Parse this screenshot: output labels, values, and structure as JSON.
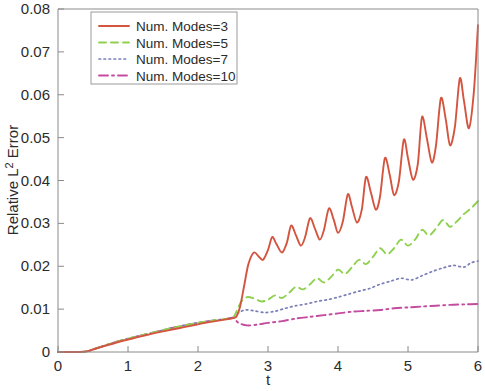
{
  "chart_data": {
    "type": "line",
    "title": "",
    "xlabel": "t",
    "ylabel": "Relative L^2 Error",
    "ylabel_display": "Relative L",
    "ylabel_sup": "2",
    "ylabel_tail": " Error",
    "xlim": [
      0,
      6
    ],
    "ylim": [
      0,
      0.08
    ],
    "xticks": [
      0,
      1,
      2,
      3,
      4,
      5,
      6
    ],
    "xtick_labels": [
      "0",
      "1",
      "2",
      "3",
      "4",
      "5",
      "6"
    ],
    "yticks": [
      0,
      0.01,
      0.02,
      0.03,
      0.04,
      0.05,
      0.06,
      0.07,
      0.08
    ],
    "ytick_labels": [
      "0",
      "0.01",
      "0.02",
      "0.03",
      "0.04",
      "0.05",
      "0.06",
      "0.07",
      "0.08"
    ],
    "grid": false,
    "legend_position": "top-left-inside",
    "series": [
      {
        "name": "Num. Modes=3",
        "color": "#d4553f",
        "dash": "solid",
        "width": 1.9,
        "x": [
          0.0,
          0.15,
          0.3,
          0.42,
          0.5,
          0.62,
          0.75,
          0.9,
          1.05,
          1.2,
          1.35,
          1.5,
          1.65,
          1.8,
          1.95,
          2.1,
          2.25,
          2.4,
          2.5,
          2.55,
          2.6,
          2.66,
          2.72,
          2.8,
          2.87,
          2.93,
          3.0,
          3.06,
          3.12,
          3.2,
          3.27,
          3.33,
          3.4,
          3.47,
          3.53,
          3.6,
          3.67,
          3.74,
          3.8,
          3.87,
          3.94,
          4.0,
          4.07,
          4.14,
          4.2,
          4.27,
          4.34,
          4.4,
          4.47,
          4.54,
          4.6,
          4.67,
          4.74,
          4.8,
          4.87,
          4.94,
          5.0,
          5.07,
          5.14,
          5.2,
          5.27,
          5.34,
          5.4,
          5.47,
          5.54,
          5.6,
          5.67,
          5.74,
          5.8,
          5.87,
          5.94,
          6.0
        ],
        "y": [
          0.0,
          0.0,
          0.0,
          0.0002,
          0.0006,
          0.0012,
          0.0018,
          0.0025,
          0.0031,
          0.0037,
          0.0043,
          0.0048,
          0.0053,
          0.0058,
          0.0063,
          0.0068,
          0.0072,
          0.0076,
          0.0079,
          0.0083,
          0.0105,
          0.0155,
          0.0205,
          0.0232,
          0.0222,
          0.0215,
          0.0238,
          0.0268,
          0.0252,
          0.0232,
          0.0255,
          0.0295,
          0.0272,
          0.0248,
          0.0268,
          0.0312,
          0.0288,
          0.0262,
          0.0285,
          0.0335,
          0.0308,
          0.0278,
          0.0305,
          0.0368,
          0.0338,
          0.0302,
          0.0332,
          0.0408,
          0.0372,
          0.0332,
          0.0362,
          0.0452,
          0.0412,
          0.0366,
          0.0398,
          0.0495,
          0.0452,
          0.0402,
          0.0438,
          0.0548,
          0.0498,
          0.0442,
          0.0482,
          0.0592,
          0.0542,
          0.0482,
          0.0525,
          0.0638,
          0.0585,
          0.0522,
          0.0605,
          0.0762
        ]
      },
      {
        "name": "Num. Modes=5",
        "color": "#8fd14f",
        "dash": "dashed",
        "width": 1.9,
        "x": [
          0.0,
          0.2,
          0.4,
          0.5,
          0.65,
          0.8,
          1.0,
          1.2,
          1.4,
          1.6,
          1.8,
          2.0,
          2.2,
          2.4,
          2.5,
          2.56,
          2.62,
          2.7,
          2.8,
          2.9,
          3.0,
          3.1,
          3.2,
          3.3,
          3.4,
          3.5,
          3.6,
          3.7,
          3.8,
          3.9,
          4.0,
          4.1,
          4.2,
          4.3,
          4.4,
          4.5,
          4.6,
          4.7,
          4.8,
          4.9,
          5.0,
          5.1,
          5.2,
          5.3,
          5.4,
          5.5,
          5.6,
          5.7,
          5.8,
          5.9,
          6.0
        ],
        "y": [
          0.0,
          0.0,
          0.0001,
          0.0006,
          0.0014,
          0.0022,
          0.0031,
          0.0039,
          0.0047,
          0.0055,
          0.0062,
          0.0068,
          0.0073,
          0.0077,
          0.008,
          0.0098,
          0.0118,
          0.0128,
          0.0125,
          0.0118,
          0.0122,
          0.0132,
          0.0126,
          0.0138,
          0.0152,
          0.0146,
          0.0158,
          0.0172,
          0.0162,
          0.0175,
          0.0192,
          0.0182,
          0.0198,
          0.0215,
          0.0205,
          0.0222,
          0.0242,
          0.0228,
          0.0242,
          0.0262,
          0.0248,
          0.0262,
          0.0285,
          0.0272,
          0.0288,
          0.0308,
          0.0292,
          0.0305,
          0.0322,
          0.0335,
          0.0352
        ]
      },
      {
        "name": "Num. Modes=7",
        "color": "#7a7fb8",
        "dash": "dotted",
        "width": 1.7,
        "x": [
          0.0,
          0.2,
          0.4,
          0.5,
          0.65,
          0.8,
          1.0,
          1.2,
          1.4,
          1.6,
          1.8,
          2.0,
          2.2,
          2.4,
          2.5,
          2.58,
          2.68,
          2.8,
          2.95,
          3.1,
          3.25,
          3.4,
          3.55,
          3.7,
          3.85,
          4.0,
          4.15,
          4.3,
          4.45,
          4.6,
          4.75,
          4.9,
          5.05,
          5.2,
          5.35,
          5.5,
          5.65,
          5.8,
          5.9,
          6.0
        ],
        "y": [
          0.0,
          0.0,
          0.0001,
          0.0006,
          0.0014,
          0.0022,
          0.0031,
          0.0039,
          0.0047,
          0.0055,
          0.0062,
          0.0068,
          0.0073,
          0.0077,
          0.008,
          0.0092,
          0.0098,
          0.0096,
          0.0092,
          0.0095,
          0.0102,
          0.0108,
          0.0112,
          0.0118,
          0.0122,
          0.0128,
          0.0135,
          0.0142,
          0.0148,
          0.0158,
          0.0165,
          0.0172,
          0.0168,
          0.0178,
          0.0188,
          0.0196,
          0.0202,
          0.0198,
          0.0208,
          0.0212
        ]
      },
      {
        "name": "Num. Modes=10",
        "color": "#c44ca0",
        "dash": "dashdot",
        "width": 1.9,
        "x": [
          0.0,
          0.2,
          0.4,
          0.5,
          0.65,
          0.8,
          1.0,
          1.2,
          1.4,
          1.6,
          1.8,
          2.0,
          2.2,
          2.4,
          2.5,
          2.58,
          2.7,
          2.85,
          3.0,
          3.2,
          3.4,
          3.6,
          3.8,
          4.0,
          4.2,
          4.4,
          4.6,
          4.8,
          5.0,
          5.2,
          5.4,
          5.6,
          5.8,
          6.0
        ],
        "y": [
          0.0,
          0.0,
          0.0001,
          0.0006,
          0.0014,
          0.0022,
          0.0031,
          0.0039,
          0.0047,
          0.0055,
          0.0062,
          0.0068,
          0.0073,
          0.0077,
          0.008,
          0.0068,
          0.0062,
          0.0064,
          0.0068,
          0.0072,
          0.0078,
          0.0082,
          0.0086,
          0.009,
          0.0094,
          0.0096,
          0.0098,
          0.0102,
          0.0104,
          0.0106,
          0.0108,
          0.011,
          0.0111,
          0.0112
        ]
      }
    ]
  },
  "legend": {
    "entries": [
      {
        "label": "Num. Modes=3"
      },
      {
        "label": "Num. Modes=5"
      },
      {
        "label": "Num. Modes=7"
      },
      {
        "label": "Num. Modes=10"
      }
    ]
  }
}
